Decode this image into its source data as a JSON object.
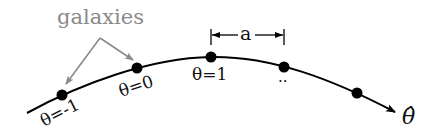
{
  "diagram": {
    "title_label": "galaxies",
    "spacing_label": "a",
    "axis_label": "θ̂",
    "ellipsis": "..",
    "galaxies": [
      {
        "label": "θ=-1",
        "x": 62,
        "y": 95
      },
      {
        "label": "θ=0",
        "x": 137,
        "y": 68
      },
      {
        "label": "θ=1",
        "x": 211,
        "y": 57
      },
      {
        "label": "",
        "x": 284,
        "y": 67
      },
      {
        "label": "",
        "x": 357,
        "y": 93
      }
    ],
    "colors": {
      "curve": "#000000",
      "dots": "#000000",
      "annotation": "#8a8a8a"
    }
  }
}
